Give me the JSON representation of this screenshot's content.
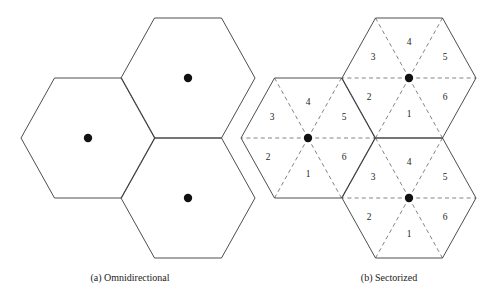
{
  "figure": {
    "width": 493,
    "height": 299,
    "background_color": "#ffffff",
    "outline_color": "#3a3a3a",
    "divider_color": "#6e6e6e",
    "dot_color": "#111111",
    "label_color": "#1d1d1d"
  },
  "panels": [
    {
      "id": "omnidirectional",
      "caption": "(a) Omnidirectional",
      "caption_x": 130,
      "caption_y": 279,
      "sectorized": false,
      "cells": [
        {
          "name": "cell-left",
          "cx": 88,
          "cy": 138,
          "rx": 67,
          "ry": 60,
          "dot_r": 4.2,
          "sectors": []
        },
        {
          "name": "cell-upper-right",
          "cx": 188,
          "cy": 78,
          "rx": 67,
          "ry": 60,
          "dot_r": 4.2,
          "sectors": []
        },
        {
          "name": "cell-lower-right",
          "cx": 188,
          "cy": 198,
          "rx": 67,
          "ry": 60,
          "dot_r": 4.2,
          "sectors": []
        }
      ]
    },
    {
      "id": "sectorized",
      "caption": "(b) Sectorized",
      "caption_x": 389,
      "caption_y": 279,
      "sectorized": true,
      "cells": [
        {
          "name": "cell-left",
          "cx": 308,
          "cy": 138,
          "rx": 67,
          "ry": 60,
          "dot_r": 4.2,
          "sectors": [
            {
              "label": "4",
              "dx": 0,
              "dy": -35
            },
            {
              "label": "3",
              "dx": -36,
              "dy": -20
            },
            {
              "label": "5",
              "dx": 36,
              "dy": -20
            },
            {
              "label": "2",
              "dx": -40,
              "dy": 20
            },
            {
              "label": "6",
              "dx": 36,
              "dy": 20
            },
            {
              "label": "1",
              "dx": 0,
              "dy": 37
            }
          ]
        },
        {
          "name": "cell-upper-right",
          "cx": 409,
          "cy": 78,
          "rx": 67,
          "ry": 60,
          "dot_r": 4.2,
          "sectors": [
            {
              "label": "4",
              "dx": 0,
              "dy": -35
            },
            {
              "label": "3",
              "dx": -36,
              "dy": -20
            },
            {
              "label": "5",
              "dx": 36,
              "dy": -20
            },
            {
              "label": "2",
              "dx": -40,
              "dy": 20
            },
            {
              "label": "6",
              "dx": 36,
              "dy": 20
            },
            {
              "label": "1",
              "dx": 0,
              "dy": 37
            }
          ]
        },
        {
          "name": "cell-lower-right",
          "cx": 409,
          "cy": 198,
          "rx": 67,
          "ry": 60,
          "dot_r": 4.2,
          "sectors": [
            {
              "label": "4",
              "dx": 0,
              "dy": -35
            },
            {
              "label": "3",
              "dx": -36,
              "dy": -20
            },
            {
              "label": "5",
              "dx": 36,
              "dy": -20
            },
            {
              "label": "2",
              "dx": -40,
              "dy": 20
            },
            {
              "label": "6",
              "dx": 36,
              "dy": 20
            },
            {
              "label": "1",
              "dx": 0,
              "dy": 37
            }
          ]
        }
      ]
    }
  ]
}
